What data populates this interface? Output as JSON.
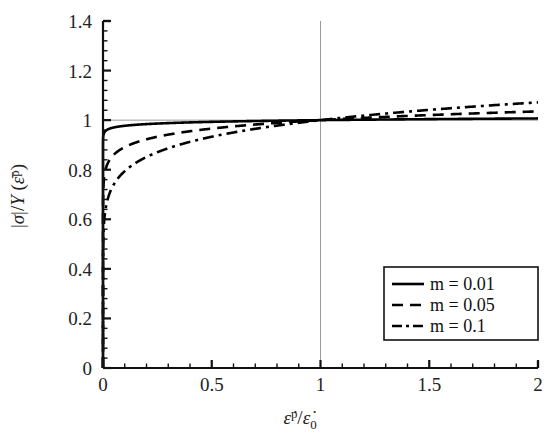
{
  "chart_data": {
    "type": "line",
    "title": "",
    "subtitle": "",
    "xlabel": "ε̇ᵖ/ε̇0",
    "ylabel": "|σ|/Y(ε̄ᵖ)",
    "xlim": [
      0,
      2
    ],
    "ylim": [
      0,
      1.4
    ],
    "xticks": [
      0,
      0.5,
      1,
      1.5,
      2
    ],
    "xtick_labels": [
      "0",
      "0.5",
      "1",
      "1.5",
      "2"
    ],
    "yticks": [
      0,
      0.2,
      0.4,
      0.6,
      0.8,
      1,
      1.2,
      1.4
    ],
    "ytick_labels": [
      "0",
      "0.2",
      "0.4",
      "0.6",
      "0.8",
      "1",
      "1.2",
      "1.4"
    ],
    "minor_ticks_per_interval": 4,
    "grid": false,
    "legend_position": "lower right",
    "reference_lines": [
      {
        "name": "horizontal-unity-line",
        "axis": "y",
        "value": 1,
        "color": "#9a9a9a"
      },
      {
        "name": "vertical-unity-line",
        "axis": "x",
        "value": 1,
        "color": "#9a9a9a"
      }
    ],
    "relation": "sigma/Y = (x)^m",
    "x": [
      0.0,
      0.005,
      0.01,
      0.02,
      0.03,
      0.05,
      0.07,
      0.1,
      0.14,
      0.18,
      0.22,
      0.28,
      0.34,
      0.4,
      0.5,
      0.6,
      0.7,
      0.8,
      0.9,
      1.0,
      1.1,
      1.2,
      1.3,
      1.4,
      1.5,
      1.6,
      1.7,
      1.8,
      1.9,
      2.0
    ],
    "series": [
      {
        "name": "m = 0.01",
        "m": 0.01,
        "style": "solid",
        "color": "#000000",
        "values": [
          0.0,
          0.948,
          0.955,
          0.962,
          0.966,
          0.971,
          0.974,
          0.977,
          0.981,
          0.983,
          0.985,
          0.987,
          0.989,
          0.991,
          0.993,
          0.995,
          0.996,
          0.998,
          0.999,
          1.0,
          1.001,
          1.002,
          1.003,
          1.003,
          1.004,
          1.005,
          1.005,
          1.006,
          1.006,
          1.007
        ]
      },
      {
        "name": "m = 0.05",
        "m": 0.05,
        "style": "dashed",
        "color": "#000000",
        "values": [
          0.0,
          0.764,
          0.794,
          0.826,
          0.845,
          0.861,
          0.875,
          0.892,
          0.906,
          0.917,
          0.926,
          0.937,
          0.945,
          0.956,
          0.966,
          0.975,
          0.982,
          0.989,
          0.995,
          1.0,
          1.005,
          1.009,
          1.013,
          1.017,
          1.021,
          1.024,
          1.027,
          1.03,
          1.033,
          1.035
        ]
      },
      {
        "name": "m = 0.1",
        "m": 0.1,
        "style": "dashdot",
        "color": "#000000",
        "values": [
          0.0,
          0.589,
          0.631,
          0.676,
          0.704,
          0.741,
          0.766,
          0.794,
          0.822,
          0.842,
          0.858,
          0.879,
          0.895,
          0.912,
          0.933,
          0.95,
          0.965,
          0.978,
          0.989,
          1.0,
          1.01,
          1.018,
          1.027,
          1.034,
          1.041,
          1.047,
          1.054,
          1.06,
          1.065,
          1.072
        ]
      }
    ],
    "legend_entries": [
      {
        "label": "m = 0.01",
        "style": "solid"
      },
      {
        "label": "m = 0.05",
        "style": "dashed"
      },
      {
        "label": "m = 0.1",
        "style": "dashdot"
      }
    ]
  }
}
